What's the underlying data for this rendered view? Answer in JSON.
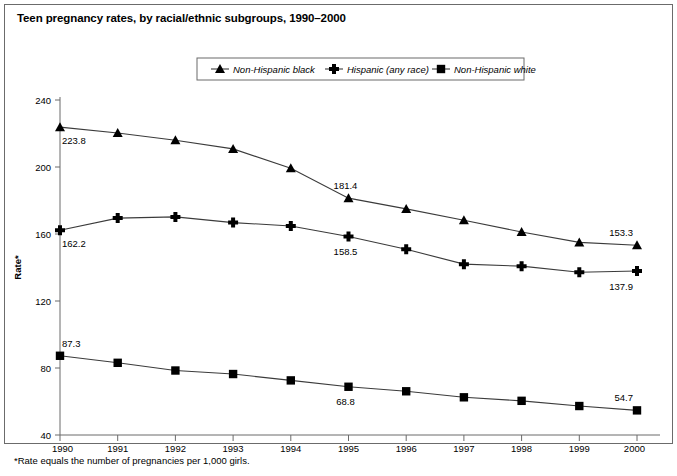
{
  "chart_title": "Teen pregnancy rates, by racial/ethnic subgroups, 1990–2000",
  "footnote": "*Rate equals the number of pregnancies per 1,000 girls.",
  "axes": {
    "ylabel": "Rate*",
    "xlabel": "",
    "yticks": [
      "240",
      "200",
      "160",
      "120",
      "80",
      "40"
    ],
    "ylim": [
      40,
      240
    ],
    "xticks": [
      "1990",
      "1991",
      "1992",
      "1993",
      "1994",
      "1995",
      "1996",
      "1997",
      "1998",
      "1999",
      "2000"
    ],
    "grid": "none"
  },
  "legend": {
    "position": "top-center",
    "entries": [
      {
        "label": "Non-Hispanic black",
        "marker": "triangle-marker"
      },
      {
        "label": "Hispanic (any race)",
        "marker": "star-marker"
      },
      {
        "label": "Non-Hispanic white",
        "marker": "square-marker"
      }
    ]
  },
  "chart_data": {
    "type": "line",
    "title": "Teen pregnancy rates, by racial/ethnic subgroups, 1990–2000",
    "xlabel": "",
    "ylabel": "Rate*",
    "ylim": [
      40,
      240
    ],
    "grid": false,
    "legend_position": "top-center",
    "x": [
      1990,
      1991,
      1992,
      1993,
      1994,
      1995,
      1996,
      1997,
      1998,
      1999,
      2000
    ],
    "categories": [
      "1990",
      "1991",
      "1992",
      "1993",
      "1994",
      "1995",
      "1996",
      "1997",
      "1998",
      "1999",
      "2000"
    ],
    "series": [
      {
        "name": "Non-Hispanic black",
        "marker": "triangle-marker",
        "values": [
          223.8,
          220.3,
          216.0,
          210.8,
          199.2,
          181.4,
          175.0,
          168.2,
          161.2,
          155.0,
          153.3
        ],
        "labels": [
          {
            "x": 1990,
            "value": 223.8,
            "text": "223.8"
          },
          {
            "x": 1995,
            "value": 181.4,
            "text": "181.4"
          },
          {
            "x": 2000,
            "value": 153.3,
            "text": "153.3"
          }
        ]
      },
      {
        "name": "Hispanic (any race)",
        "marker": "star-marker",
        "values": [
          162.2,
          169.5,
          170.2,
          166.8,
          164.8,
          158.5,
          150.9,
          142.0,
          140.8,
          137.2,
          137.9
        ],
        "labels": [
          {
            "x": 1990,
            "value": 162.2,
            "text": "162.2"
          },
          {
            "x": 1995,
            "value": 158.5,
            "text": "158.5"
          },
          {
            "x": 2000,
            "value": 137.9,
            "text": "137.9"
          }
        ]
      },
      {
        "name": "Non-Hispanic white",
        "marker": "square-marker",
        "values": [
          87.3,
          83.1,
          78.5,
          76.4,
          72.6,
          68.8,
          66.1,
          62.5,
          60.4,
          57.3,
          54.7
        ],
        "labels": [
          {
            "x": 1990,
            "value": 87.3,
            "text": "87.3"
          },
          {
            "x": 1995,
            "value": 68.8,
            "text": "68.8"
          },
          {
            "x": 2000,
            "value": 54.7,
            "text": "54.7"
          }
        ]
      }
    ]
  },
  "colors": {
    "ink": "#000000",
    "line": "#3b3b3b",
    "axis": "#6b6b6b",
    "background": "#ffffff"
  }
}
